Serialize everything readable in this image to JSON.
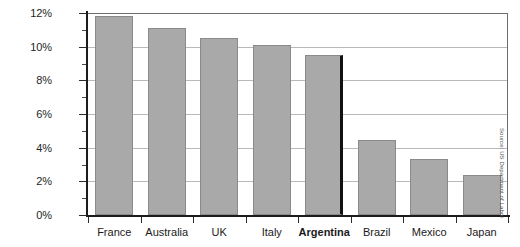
{
  "chart_data": {
    "type": "bar",
    "title": "",
    "subtitle": "",
    "xlabel": "",
    "ylabel": "",
    "categories": [
      "France",
      "Australia",
      "UK",
      "Italy",
      "Argentina",
      "Brazil",
      "Mexico",
      "Japan"
    ],
    "values": [
      11.8,
      11.1,
      10.5,
      10.1,
      9.5,
      4.45,
      3.3,
      2.35
    ],
    "highlighted_category": "Argentina",
    "ylim": [
      0,
      12
    ],
    "y_tick_labels": [
      "0%",
      "2%",
      "4%",
      "6%",
      "8%",
      "10%",
      "12%"
    ],
    "y_tick_values": [
      0,
      2,
      4,
      6,
      8,
      10,
      12
    ],
    "y_minor_tick_values": [
      1,
      3,
      5,
      7,
      9,
      11
    ],
    "grid": true,
    "legend": "none",
    "bar_color": "#a9a9a9",
    "bar_border_color": "#8a8a8a",
    "highlight_edge_color": "#111111",
    "gridline_color": "#b9b9b9",
    "axis_color": "#1c1c1c",
    "source_note": "Source: US Department of Labor"
  }
}
